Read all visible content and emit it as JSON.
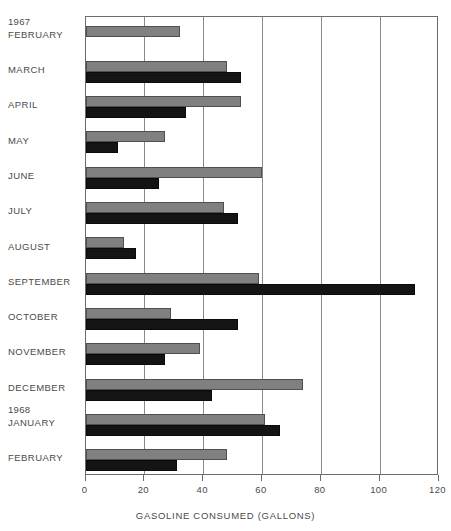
{
  "chart_data": {
    "type": "bar",
    "orientation": "horizontal",
    "title": "",
    "xlabel": "GASOLINE CONSUMED (GALLONS)",
    "ylabel": "",
    "xlim": [
      0,
      120
    ],
    "xticks": [
      0,
      20,
      40,
      60,
      80,
      100,
      120
    ],
    "grid": true,
    "legend": "none",
    "categories": [
      "FEBRUARY",
      "MARCH",
      "APRIL",
      "MAY",
      "JUNE",
      "JULY",
      "AUGUST",
      "SEPTEMBER",
      "OCTOBER",
      "NOVEMBER",
      "DECEMBER",
      "JANUARY",
      "FEBRUARY"
    ],
    "year_markers": [
      {
        "label": "1967",
        "before_category_index": 0
      },
      {
        "label": "1968",
        "before_category_index": 11
      }
    ],
    "series": [
      {
        "name": "gray-series",
        "color": "#808080",
        "values": [
          32,
          48,
          53,
          27,
          60,
          47,
          13,
          59,
          29,
          39,
          74,
          61,
          48
        ]
      },
      {
        "name": "black-series",
        "color": "#141414",
        "values": [
          0,
          53,
          34,
          11,
          25,
          52,
          17,
          112,
          52,
          27,
          43,
          66,
          31
        ]
      }
    ]
  },
  "axis": {
    "tick_labels": [
      "0",
      "20",
      "40",
      "60",
      "80",
      "100",
      "120"
    ],
    "title": "GASOLINE CONSUMED (GALLONS)"
  },
  "colors": {
    "gray_bar": "#808080",
    "black_bar": "#141414",
    "gridline": "#8a8a8a",
    "frame": "#6b6b6b",
    "text": "#4a4a4a",
    "background": "#ffffff"
  }
}
